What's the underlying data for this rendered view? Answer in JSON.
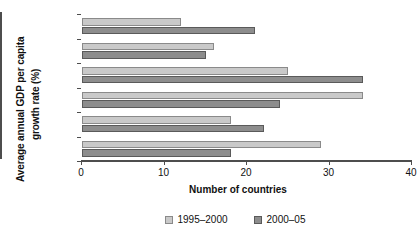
{
  "chart_data": {
    "type": "bar",
    "orientation": "horizontal",
    "title": "",
    "xlabel": "Number of countries",
    "ylabel": "Average annual GDP per capita growth rate (%)",
    "ylabel_lines": [
      "Average annual GDP per capita",
      "growth rate (%)"
    ],
    "categories": [
      "> 6",
      "4 to 6",
      "2.5 to 4",
      "1 to 2.5",
      "0 to 1",
      "< 0"
    ],
    "series": [
      {
        "name": "1995–2000",
        "color": "#c9c9c9",
        "values": [
          12,
          16,
          25,
          34,
          18,
          29
        ]
      },
      {
        "name": "2000–05",
        "color": "#8d8d8d",
        "values": [
          21,
          15,
          34,
          24,
          22,
          18
        ]
      }
    ],
    "xlim": [
      0,
      40
    ],
    "xticks": [
      0,
      10,
      20,
      30,
      40
    ],
    "xticklabels": [
      "0",
      "10",
      "20",
      "30",
      "40"
    ],
    "grid": false,
    "legend_position": "bottom"
  },
  "legend": {
    "items": [
      {
        "label": "1995–2000"
      },
      {
        "label": "2000–05"
      }
    ]
  }
}
